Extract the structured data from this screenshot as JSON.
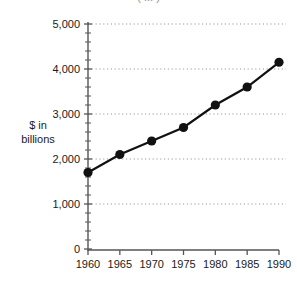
{
  "chart_data": {
    "type": "line",
    "title": "( ... )",
    "xlabel": "",
    "ylabel": "$ in\nbillions",
    "ylabel_line1": "$ in",
    "ylabel_line2": "billions",
    "categories": [
      1960,
      1965,
      1970,
      1975,
      1980,
      1985,
      1990
    ],
    "x": [
      1960,
      1965,
      1970,
      1975,
      1980,
      1985,
      1990
    ],
    "values": [
      1700,
      2100,
      2400,
      2700,
      3200,
      3600,
      4150
    ],
    "series": [
      {
        "name": "",
        "values": [
          1700,
          2100,
          2400,
          2700,
          3200,
          3600,
          4150
        ]
      }
    ],
    "xtick_labels": [
      "1960",
      "1965",
      "1970",
      "1975",
      "1980",
      "1985",
      "1990"
    ],
    "ytick_labels": [
      "0",
      "1,000",
      "2,000",
      "3,000",
      "4,000",
      "5,000"
    ],
    "ytick_values": [
      0,
      1000,
      2000,
      3000,
      4000,
      5000
    ],
    "ylim": [
      0,
      5000
    ],
    "xlim": [
      1960,
      1990
    ],
    "grid": "horizontal-dotted",
    "minor_ticks_y": 200,
    "legend": "none",
    "marker": "filled-circle",
    "colors": {
      "line": "#111111",
      "marker": "#111111",
      "axis": "#555555",
      "grid": "#9a9a9a",
      "background": "#ffffff",
      "text": "#1a1a1a"
    }
  }
}
